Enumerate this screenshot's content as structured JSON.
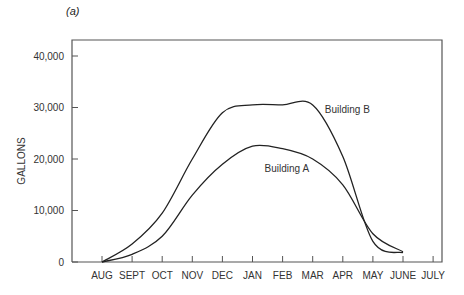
{
  "panel_label": "(a)",
  "chart_data": {
    "type": "line",
    "title": "",
    "panel": "(a)",
    "xlabel": "",
    "ylabel": "GALLONS",
    "categories": [
      "AUG",
      "SEPT",
      "OCT",
      "NOV",
      "DEC",
      "JAN",
      "FEB",
      "MAR",
      "APR",
      "MAY",
      "JUNE",
      "JULY"
    ],
    "yticks": [
      0,
      10000,
      20000,
      30000,
      40000
    ],
    "ytick_labels": [
      "0",
      "10,000",
      "20,000",
      "30,000",
      "40,000"
    ],
    "ylim": [
      0,
      43000
    ],
    "grid": false,
    "legend": "inline labels",
    "series": [
      {
        "name": "Building A",
        "values": [
          0,
          1500,
          5000,
          13000,
          19000,
          22500,
          22000,
          20000,
          15000,
          5500,
          2000,
          null
        ]
      },
      {
        "name": "Building B",
        "values": [
          0,
          3500,
          9500,
          20000,
          29000,
          30500,
          30500,
          30500,
          20500,
          4000,
          1800,
          null
        ]
      }
    ],
    "annotations": [
      {
        "text": "Building A",
        "x": "FEB",
        "y": 17500
      },
      {
        "text": "Building B",
        "x": "APR",
        "y": 29000
      }
    ]
  }
}
